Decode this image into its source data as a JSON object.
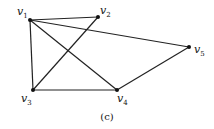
{
  "diagram": {
    "type": "graph",
    "caption": "(c)",
    "vertices": [
      {
        "id": "v1",
        "name": "v",
        "sub": "1",
        "x": 30,
        "y": 20,
        "lx": 17,
        "ly": 15
      },
      {
        "id": "v2",
        "name": "v",
        "sub": "2",
        "x": 98,
        "y": 17,
        "lx": 100,
        "ly": 14
      },
      {
        "id": "v3",
        "name": "v",
        "sub": "3",
        "x": 33,
        "y": 90,
        "lx": 21,
        "ly": 102
      },
      {
        "id": "v4",
        "name": "v",
        "sub": "4",
        "x": 117,
        "y": 90,
        "lx": 117,
        "ly": 102
      },
      {
        "id": "v5",
        "name": "v",
        "sub": "5",
        "x": 189,
        "y": 47,
        "lx": 194,
        "ly": 53
      }
    ],
    "edges": [
      [
        "v1",
        "v2"
      ],
      [
        "v1",
        "v3"
      ],
      [
        "v1",
        "v4"
      ],
      [
        "v1",
        "v5"
      ],
      [
        "v2",
        "v3"
      ],
      [
        "v3",
        "v4"
      ],
      [
        "v4",
        "v5"
      ]
    ],
    "colors": {
      "edge": "#222222",
      "vertex": "#111111"
    }
  }
}
